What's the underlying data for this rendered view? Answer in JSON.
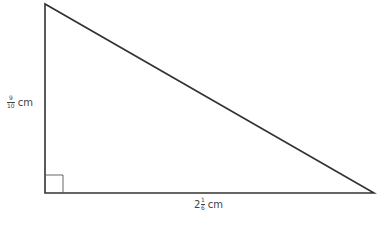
{
  "figure": {
    "type": "right-triangle",
    "vertices": {
      "top": [
        45,
        4
      ],
      "bottom_left": [
        45,
        193
      ],
      "bottom_right": [
        374,
        193
      ]
    },
    "right_angle_marker": {
      "x": 45,
      "y": 175,
      "size": 18
    },
    "stroke_color": "#333333"
  },
  "labels": {
    "height": {
      "numerator": "9",
      "denominator": "10",
      "unit": "cm"
    },
    "base": {
      "whole": "2",
      "numerator": "1",
      "denominator": "6",
      "unit": "cm"
    }
  }
}
